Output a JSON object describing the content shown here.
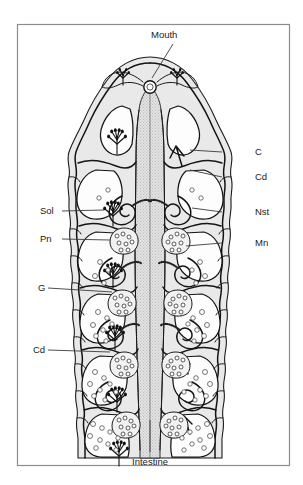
{
  "figure": {
    "orientation": "anterior-top",
    "frame_color": "#8d8d8d",
    "background_color": "#ffffff",
    "ink_color": "#131313"
  },
  "labels": {
    "mouth": "Mouth",
    "intestine": "Intestine",
    "right": [
      {
        "key": "c",
        "text": "C"
      },
      {
        "key": "cd",
        "text": "Cd"
      },
      {
        "key": "nst",
        "text": "Nst"
      },
      {
        "key": "mn",
        "text": "Mn"
      }
    ],
    "left": [
      {
        "key": "sol",
        "text": "Sol"
      },
      {
        "key": "pn",
        "text": "Pn"
      },
      {
        "key": "g",
        "text": "G"
      },
      {
        "key": "cd",
        "text": "Cd"
      }
    ]
  },
  "structures": {
    "mouth_opening": "mouth-opening",
    "central_gut": "intestine-lumen",
    "body_wall": "tegument-layer",
    "segments": "repeating-body-segments",
    "branching_organs": "branched-gland-clusters",
    "coiled_ducts": "coiled-duct",
    "granular_masses": "granular-cell-mass"
  }
}
